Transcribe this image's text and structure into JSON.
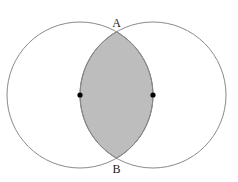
{
  "diagram": {
    "type": "two-circle-intersection (vesica piscis)",
    "labels": {
      "top_intersection": "A",
      "bottom_intersection": "B"
    },
    "circles": [
      {
        "name": "left-circle",
        "cx": 80,
        "cy": 95,
        "r": 73
      },
      {
        "name": "right-circle",
        "cx": 153,
        "cy": 95,
        "r": 73
      }
    ],
    "centers_marked": true,
    "shaded_region": "intersection (lens) of both circles",
    "colors": {
      "stroke": "#8a8a8a",
      "shade": "#bdbdbd",
      "lens_stroke": "#6f6f6f",
      "dot": "#000000"
    }
  }
}
